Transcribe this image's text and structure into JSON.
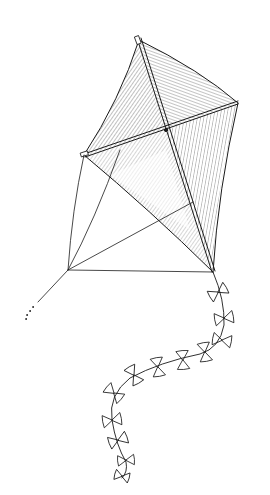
{
  "image": {
    "subject": "kite line drawing",
    "style": "black ink hatched illustration on white",
    "background": "#ffffff",
    "ink_color": "#1a1a1a"
  },
  "kite": {
    "top_tip": [
      139,
      40
    ],
    "right_tip": [
      238,
      103
    ],
    "left_tip": [
      84,
      155
    ],
    "center_cross": [
      166,
      130
    ],
    "bottom_tip": [
      213,
      272
    ],
    "bridle_point": [
      68,
      270
    ],
    "string_end": [
      38,
      302
    ]
  },
  "tail": {
    "bow_count": 12,
    "bows": [
      [
        218,
        292
      ],
      [
        224,
        318
      ],
      [
        222,
        340
      ],
      [
        205,
        352
      ],
      [
        183,
        360
      ],
      [
        158,
        367
      ],
      [
        134,
        375
      ],
      [
        114,
        393
      ],
      [
        112,
        420
      ],
      [
        118,
        440
      ],
      [
        126,
        460
      ],
      [
        122,
        476
      ]
    ]
  }
}
